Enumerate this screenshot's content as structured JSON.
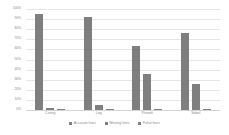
{
  "chart_data": {
    "type": "bar",
    "title": "",
    "subtitle": "",
    "xlabel": "",
    "ylabel": "",
    "categories": [
      "Canny",
      "Log",
      "Prewitt",
      "Sobel"
    ],
    "series": [
      {
        "name": "Accurate lines",
        "values": [
          95,
          92,
          63,
          76
        ],
        "color": "#7f7f7f"
      },
      {
        "name": "Missing lines",
        "values": [
          2,
          5,
          36,
          26
        ],
        "color": "#7f7f7f"
      },
      {
        "name": "False lines",
        "values": [
          1,
          1,
          0,
          0
        ],
        "color": "#7f7f7f"
      }
    ],
    "ylim": [
      0,
      100
    ],
    "ytick_values": [
      0,
      10,
      20,
      30,
      40,
      50,
      60,
      70,
      80,
      90,
      100
    ],
    "ytick_labels": [
      "0%",
      "10%",
      "20%",
      "30%",
      "40%",
      "50%",
      "60%",
      "70%",
      "80%",
      "90%",
      "100%"
    ],
    "grid": true,
    "grid_color": "#e6e6e6",
    "legend_position": "bottom",
    "background": "#ffffff",
    "axis_text_color": "#8a8a8a"
  }
}
